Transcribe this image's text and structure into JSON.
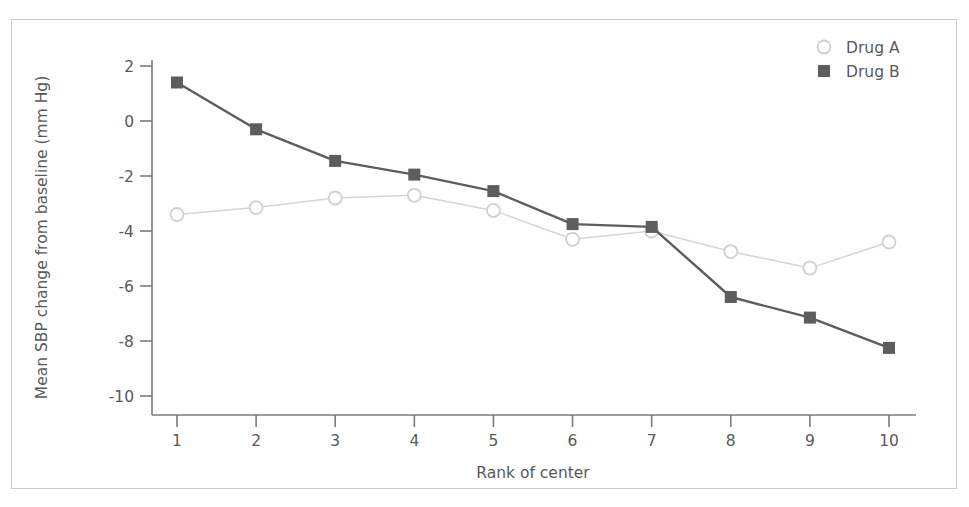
{
  "figure": {
    "background_color": "#ffffff",
    "frame_color": "#c9c9cb",
    "text_color": "#59595b"
  },
  "legend": {
    "position": "top-right",
    "entries": [
      {
        "label": "Drug A",
        "marker": "open-circle",
        "color": "#d0d0d2"
      },
      {
        "label": "Drug B",
        "marker": "filled-square",
        "color": "#5d5d5f"
      }
    ]
  },
  "axes": {
    "x": {
      "label": "Rank of center",
      "ticks": [
        "1",
        "2",
        "3",
        "4",
        "5",
        "6",
        "7",
        "8",
        "9",
        "10"
      ],
      "min": 1,
      "max": 10
    },
    "y": {
      "label": "Mean SBP change from baseline (mm Hg)",
      "ticks": [
        "2",
        "0",
        "-2",
        "-4",
        "-6",
        "-8",
        "-10"
      ],
      "min": -10,
      "max": 2
    }
  },
  "chart_data": {
    "type": "line",
    "title": "",
    "subtitle": "",
    "xlabel": "Rank of center",
    "ylabel": "Mean SBP change from baseline (mm Hg)",
    "x": [
      1,
      2,
      3,
      4,
      5,
      6,
      7,
      8,
      9,
      10
    ],
    "categories": [
      "1",
      "2",
      "3",
      "4",
      "5",
      "6",
      "7",
      "8",
      "9",
      "10"
    ],
    "xlim": [
      1,
      10
    ],
    "ylim": [
      -10,
      2
    ],
    "yticks": [
      2,
      0,
      -2,
      -4,
      -6,
      -8,
      -10
    ],
    "grid": false,
    "legend_position": "top-right",
    "series": [
      {
        "name": "Drug A",
        "marker": "open-circle",
        "color": "#d0d0d2",
        "line_color": "#d5d5d7",
        "values": [
          -3.4,
          -3.15,
          -2.8,
          -2.7,
          -3.25,
          -4.3,
          -4.0,
          -4.75,
          -5.35,
          -4.4
        ]
      },
      {
        "name": "Drug B",
        "marker": "filled-square",
        "color": "#5d5d5f",
        "line_color": "#5d5d5f",
        "values": [
          1.4,
          -0.3,
          -1.45,
          -1.95,
          -2.55,
          -3.75,
          -3.85,
          -6.4,
          -7.15,
          -8.25
        ]
      }
    ]
  }
}
